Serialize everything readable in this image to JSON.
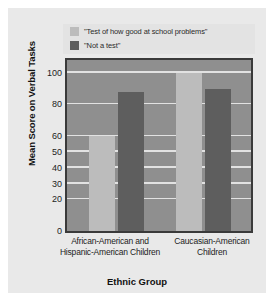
{
  "figure": {
    "background_color": "#e9e9e9",
    "plot_background_color": "#8f8f8f",
    "plot_border_color": "#3a3a3a",
    "gridline_color": "#e2e2e2"
  },
  "legend": {
    "background_color": "#e3e3e3",
    "items": [
      {
        "label": "\"Test of how good at school problems\"",
        "color": "#bcbcbc"
      },
      {
        "label": "\"Not a test\"",
        "color": "#5e5e5e"
      }
    ]
  },
  "chart_data": {
    "type": "bar",
    "title": "",
    "xlabel": "Ethnic Group",
    "ylabel": "Mean Score on Verbal Tasks",
    "categories": [
      "African-American and Hispanic-American Children",
      "Caucasian-American Children"
    ],
    "series": [
      {
        "name": "\"Test of how good at school problems\"",
        "color": "#bcbcbc",
        "values": [
          60,
          100
        ]
      },
      {
        "name": "\"Not a test\"",
        "color": "#5e5e5e",
        "values": [
          88,
          90
        ]
      }
    ],
    "ylim": [
      0,
      108
    ],
    "yticks": [
      0,
      20,
      30,
      40,
      50,
      60,
      80,
      100
    ],
    "ytick_labels": [
      "0",
      "20",
      "30",
      "40",
      "50",
      "60",
      "80",
      "100"
    ],
    "gridlines": [
      20,
      30,
      40,
      50,
      60,
      80,
      100
    ],
    "grid": true,
    "legend_position": "top"
  }
}
